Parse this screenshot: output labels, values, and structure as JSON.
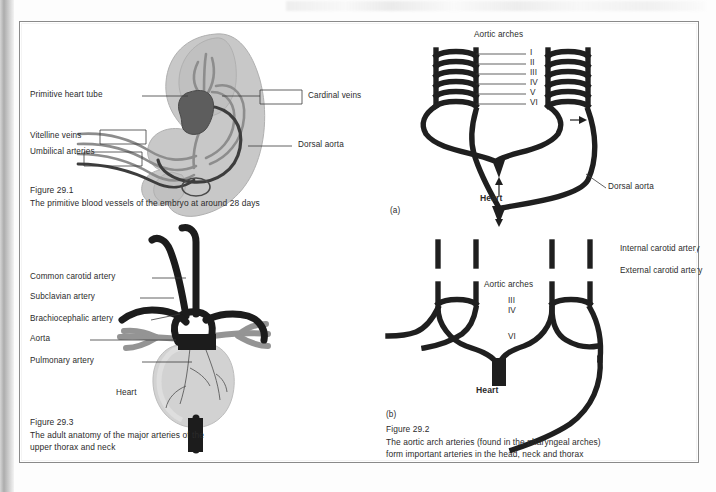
{
  "page": {
    "background_color": "#ffffff",
    "border_color": "#8a8a8a",
    "binding_strip": "left-gutter-shadow",
    "bleed_through_text": ""
  },
  "figures": [
    {
      "id": "fig-29-1",
      "number": "Figure 29.1",
      "caption": "The primitive blood vessels of the embryo at around 28 days",
      "position": "top-left",
      "subject": "embryo-primitive-blood-vessels",
      "colors": {
        "body": "#c4c4c4",
        "vessel": "#8c8c8c",
        "heart_tube": "#5a5a5a",
        "aorta": "#3a3a3a"
      },
      "labels": [
        {
          "name": "primitive-heart-tube",
          "text": "Primitive heart tube",
          "side": "left",
          "leader": "line"
        },
        {
          "name": "cardinal-veins",
          "text": "Cardinal veins",
          "side": "right",
          "leader": "bracket"
        },
        {
          "name": "vitelline-veins",
          "text": "Vitelline veins",
          "side": "left",
          "leader": "bracket"
        },
        {
          "name": "umbilical-arteries",
          "text": "Umbilical\narteries",
          "side": "left",
          "leader": "bracket"
        },
        {
          "name": "dorsal-aorta",
          "text": "Dorsal aorta",
          "side": "right",
          "leader": "line"
        }
      ]
    },
    {
      "id": "fig-29-3",
      "number": "Figure 29.3",
      "caption": "The adult anatomy of the major arteries of the\nupper thorax and neck",
      "position": "bottom-left",
      "subject": "adult-thoracic-arteries",
      "colors": {
        "artery": "#1f1f1f",
        "pulmonary": "#8f8f8f",
        "heart": "#cfcfcf"
      },
      "labels": [
        {
          "name": "common-carotid-artery",
          "text": "Common carotid artery"
        },
        {
          "name": "subclavian-artery",
          "text": "Subclavian artery"
        },
        {
          "name": "brachiocephalic-artery",
          "text": "Brachiocephalic artery"
        },
        {
          "name": "aorta",
          "text": "Aorta"
        },
        {
          "name": "pulmonary-artery",
          "text": "Pulmonary artery"
        },
        {
          "name": "heart",
          "text": "Heart"
        }
      ]
    },
    {
      "id": "fig-29-2",
      "number": "Figure 29.2",
      "caption": "The aortic arch arteries (found in the pharyngeal arches)\nform important arteries in the head, neck and thorax",
      "position": "right-column",
      "subject": "aortic-arch-arteries",
      "colors": {
        "vessel": "#1f1f1f"
      },
      "panels": [
        {
          "key": "a",
          "panel_label": "(a)",
          "title": "Aortic arches",
          "arch_numerals": [
            "I",
            "II",
            "III",
            "IV",
            "V",
            "VI"
          ],
          "labels": [
            {
              "name": "heart",
              "text": "Heart"
            },
            {
              "name": "dorsal-aorta",
              "text": "Dorsal\naorta"
            }
          ]
        },
        {
          "key": "b",
          "panel_label": "(b)",
          "title": "Aortic arches",
          "arch_numerals": [
            "III",
            "IV",
            "VI"
          ],
          "labels": [
            {
              "name": "internal-carotid-artery",
              "text": "Internal carotid artery"
            },
            {
              "name": "external-carotid-artery",
              "text": "External carotid artery"
            },
            {
              "name": "heart",
              "text": "Heart"
            }
          ]
        }
      ]
    }
  ]
}
